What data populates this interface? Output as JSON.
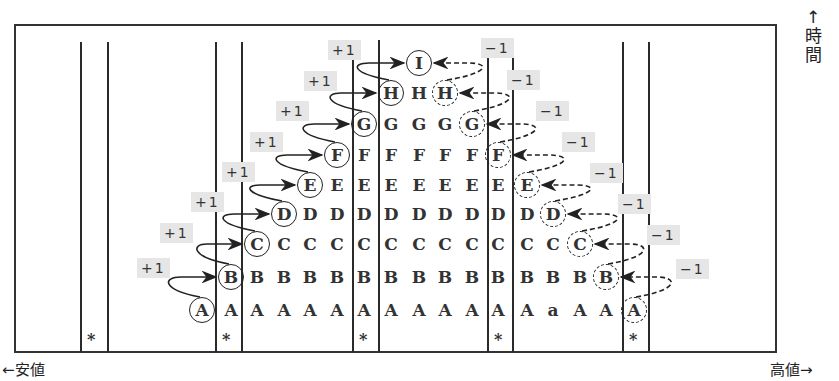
{
  "title_fragment": "図",
  "axes": {
    "x_left": "←安値",
    "x_right": "高値→",
    "y_arrow": "↑",
    "y_label_chars": [
      "時",
      "間"
    ]
  },
  "badges": {
    "plus": "+1",
    "minus": "−1"
  },
  "star_symbol": "*",
  "columns_x": [
    202,
    231,
    257,
    284,
    310,
    337,
    364,
    391,
    419,
    445,
    472,
    498,
    527,
    553,
    580,
    606,
    634
  ],
  "rows": [
    {
      "letter": "A",
      "y": 310,
      "circle": 0,
      "fill": [
        1,
        15
      ],
      "dashed": 16,
      "exceptions": {
        "13": "a"
      }
    },
    {
      "letter": "B",
      "y": 277,
      "circle": 1,
      "fill": [
        2,
        14
      ],
      "dashed": 15
    },
    {
      "letter": "C",
      "y": 244,
      "circle": 2,
      "fill": [
        3,
        13
      ],
      "dashed": 14
    },
    {
      "letter": "D",
      "y": 214,
      "circle": 3,
      "fill": [
        4,
        12
      ],
      "dashed": 13
    },
    {
      "letter": "E",
      "y": 185,
      "circle": 4,
      "fill": [
        5,
        11
      ],
      "dashed": 12
    },
    {
      "letter": "F",
      "y": 155,
      "circle": 5,
      "fill": [
        6,
        10
      ],
      "dashed": 11
    },
    {
      "letter": "G",
      "y": 124,
      "circle": 6,
      "fill": [
        7,
        9
      ],
      "dashed": 10
    },
    {
      "letter": "H",
      "y": 93,
      "circle": 7,
      "fill": [
        8,
        8
      ],
      "dashed": 9
    },
    {
      "letter": "I",
      "y": 63,
      "circle": 8,
      "fill": null,
      "dashed": null
    }
  ],
  "vertical_line_pairs": [
    [
      80,
      107
    ],
    [
      215,
      241
    ],
    [
      352,
      378
    ],
    [
      487,
      512
    ],
    [
      622,
      648
    ]
  ],
  "stars_x": [
    93,
    228,
    365,
    500,
    635
  ],
  "plus_badges": [
    {
      "x": 137,
      "y": 258
    },
    {
      "x": 160,
      "y": 223
    },
    {
      "x": 191,
      "y": 192
    },
    {
      "x": 222,
      "y": 162
    },
    {
      "x": 250,
      "y": 132
    },
    {
      "x": 276,
      "y": 101
    },
    {
      "x": 304,
      "y": 71
    },
    {
      "x": 328,
      "y": 40
    }
  ],
  "minus_badges": [
    {
      "x": 676,
      "y": 259
    },
    {
      "x": 647,
      "y": 225
    },
    {
      "x": 618,
      "y": 194
    },
    {
      "x": 590,
      "y": 163
    },
    {
      "x": 562,
      "y": 132
    },
    {
      "x": 536,
      "y": 101
    },
    {
      "x": 507,
      "y": 70
    },
    {
      "x": 481,
      "y": 38
    }
  ]
}
